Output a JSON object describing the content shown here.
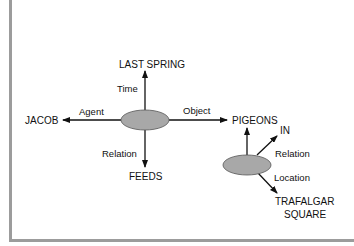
{
  "diagram": {
    "type": "semantic-network / propositional network",
    "colors": {
      "ellipse_fill": "#a8a8a8",
      "ellipse_stroke": "#555555",
      "line": "#111111",
      "border": "#9c9c9c"
    },
    "proposition_1": {
      "center_node": "proposition-1",
      "edges": [
        {
          "label": "Time",
          "target": "LAST SPRING",
          "direction": "up"
        },
        {
          "label": "Agent",
          "target": "JACOB",
          "direction": "left"
        },
        {
          "label": "Object",
          "target": "PIGEONS",
          "direction": "right"
        },
        {
          "label": "Relation",
          "target": "FEEDS",
          "direction": "down"
        }
      ]
    },
    "proposition_2": {
      "center_node": "proposition-2",
      "edges": [
        {
          "label": "",
          "target": "PIGEONS",
          "direction": "up"
        },
        {
          "label": "Relation",
          "target": "IN",
          "direction": "up-right"
        },
        {
          "label": "Location",
          "target": "TRAFALGAR SQUARE",
          "direction": "down-right"
        }
      ]
    },
    "nodes": {
      "last_spring": "LAST SPRING",
      "jacob": "JACOB",
      "pigeons": "PIGEONS",
      "feeds": "FEEDS",
      "in": "IN",
      "trafalgar_line1": "TRAFALGAR",
      "trafalgar_line2": "SQUARE"
    },
    "edge_labels": {
      "time": "Time",
      "agent": "Agent",
      "object": "Object",
      "relation1": "Relation",
      "relation2": "Relation",
      "location": "Location"
    }
  }
}
